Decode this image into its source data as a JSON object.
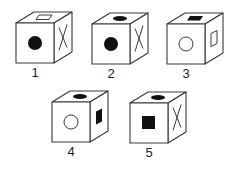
{
  "style": {
    "stroke": "#3a3a3a",
    "fill": "#111111",
    "bg": "#ffffff"
  },
  "cube_size": {
    "w": 38,
    "h": 40,
    "dx": 18,
    "dy": -11
  },
  "cubes": [
    {
      "label": "1",
      "x": 16,
      "y": 23,
      "front": "filled-circle",
      "side": "x-cross",
      "top": "hollow-rect"
    },
    {
      "label": "2",
      "x": 92,
      "y": 24,
      "front": "filled-circle",
      "side": "x-cross",
      "top": "filled-ellipse"
    },
    {
      "label": "3",
      "x": 167,
      "y": 24,
      "front": "hollow-circle",
      "side": "hollow-rect",
      "top": "filled-rect"
    },
    {
      "label": "4",
      "x": 52,
      "y": 102,
      "front": "hollow-circle",
      "side": "filled-rect",
      "top": "filled-ellipse"
    },
    {
      "label": "5",
      "x": 130,
      "y": 103,
      "front": "filled-square",
      "side": "x-cross",
      "top": "filled-ellipse"
    }
  ]
}
